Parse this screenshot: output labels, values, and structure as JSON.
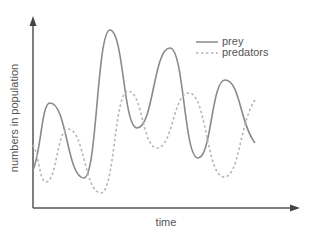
{
  "chart_data": {
    "type": "line",
    "title": "",
    "xlabel": "time",
    "ylabel": "numbers in population",
    "grid": false,
    "legend_position": "upper right",
    "axes": {
      "x_ticks": [],
      "y_ticks": [],
      "arrows": true
    },
    "series": [
      {
        "name": "prey",
        "style": "solid",
        "color": "#8a8a8a",
        "points": [
          [
            33,
            170
          ],
          [
            50,
            103
          ],
          [
            84,
            178
          ],
          [
            110,
            30
          ],
          [
            137,
            128
          ],
          [
            170,
            48
          ],
          [
            198,
            158
          ],
          [
            225,
            80
          ],
          [
            255,
            143
          ]
        ]
      },
      {
        "name": "predators",
        "style": "dashed",
        "color": "#b5b5b5",
        "points": [
          [
            33,
            145
          ],
          [
            46,
            182
          ],
          [
            68,
            129
          ],
          [
            101,
            193
          ],
          [
            128,
            91
          ],
          [
            157,
            148
          ],
          [
            189,
            93
          ],
          [
            224,
            177
          ],
          [
            255,
            100
          ]
        ]
      }
    ]
  },
  "legend": {
    "items": [
      {
        "label": "prey",
        "style": "solid",
        "color": "#8a8a8a"
      },
      {
        "label": "predators",
        "style": "dashed",
        "color": "#b5b5b5"
      }
    ]
  },
  "axes_color": "#555555"
}
